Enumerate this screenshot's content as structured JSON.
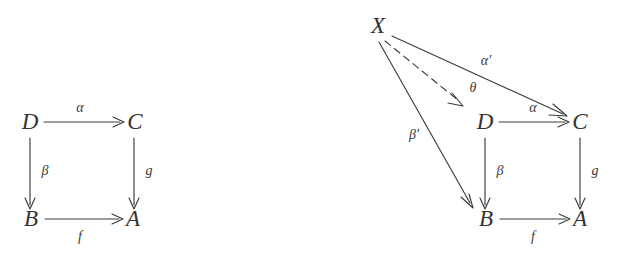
{
  "figure": {
    "background_color": "#ffffff",
    "stroke_color": "#3c3c3c",
    "text_color": "#333333",
    "diagrams": [
      {
        "id": "left-diagram",
        "name": "commutative-square",
        "nodes": [
          {
            "id": "D",
            "label": "D",
            "x": 30,
            "y": 124
          },
          {
            "id": "C",
            "label": "C",
            "x": 135,
            "y": 124
          },
          {
            "id": "B",
            "label": "B",
            "x": 31,
            "y": 221
          },
          {
            "id": "A",
            "label": "A",
            "x": 133,
            "y": 221
          }
        ],
        "edges": [
          {
            "id": "D-to-C",
            "from": "D",
            "to": "C",
            "label": "α",
            "label_x": 80,
            "label_y": 109,
            "style": "solid"
          },
          {
            "id": "D-to-B",
            "from": "D",
            "to": "B",
            "label": "β",
            "label_x": 45,
            "label_y": 172,
            "style": "solid"
          },
          {
            "id": "C-to-A",
            "from": "C",
            "to": "A",
            "label": "g",
            "label_x": 149,
            "label_y": 172,
            "style": "solid"
          },
          {
            "id": "B-to-A",
            "from": "B",
            "to": "A",
            "label": "f",
            "label_x": 80,
            "label_y": 238,
            "style": "solid"
          }
        ]
      },
      {
        "id": "right-diagram",
        "name": "universal-property-diagram",
        "nodes": [
          {
            "id": "X",
            "label": "X",
            "x": 378,
            "y": 28
          },
          {
            "id": "D",
            "label": "D",
            "x": 485,
            "y": 124
          },
          {
            "id": "C",
            "label": "C",
            "x": 580,
            "y": 124
          },
          {
            "id": "B",
            "label": "B",
            "x": 486,
            "y": 221
          },
          {
            "id": "A",
            "label": "A",
            "x": 580,
            "y": 221
          }
        ],
        "edges": [
          {
            "id": "X-to-C",
            "from": "X",
            "to": "C",
            "label": "α′",
            "label_x": 486,
            "label_y": 62,
            "style": "solid"
          },
          {
            "id": "X-to-D",
            "from": "X",
            "to": "D",
            "label": "θ",
            "label_x": 473,
            "label_y": 89,
            "style": "dashed"
          },
          {
            "id": "X-to-B",
            "from": "X",
            "to": "B",
            "label": "β′",
            "label_x": 414,
            "label_y": 136,
            "style": "solid"
          },
          {
            "id": "D-to-C",
            "from": "D",
            "to": "C",
            "label": "α",
            "label_x": 533,
            "label_y": 109,
            "style": "solid"
          },
          {
            "id": "D-to-B",
            "from": "D",
            "to": "B",
            "label": "β",
            "label_x": 500,
            "label_y": 172,
            "style": "solid"
          },
          {
            "id": "C-to-A",
            "from": "C",
            "to": "A",
            "label": "g",
            "label_x": 595,
            "label_y": 172,
            "style": "solid"
          },
          {
            "id": "B-to-A",
            "from": "B",
            "to": "A",
            "label": "f",
            "label_x": 533,
            "label_y": 238,
            "style": "solid"
          }
        ]
      }
    ]
  }
}
